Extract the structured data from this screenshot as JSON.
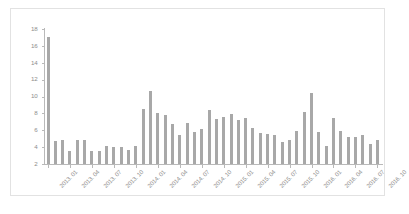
{
  "chart_data": {
    "type": "bar",
    "title": "",
    "subtitle": "",
    "xlabel": "",
    "ylabel": "",
    "ylim": [
      2,
      18
    ],
    "yticks": [
      2,
      4,
      6,
      8,
      10,
      12,
      14,
      16,
      18
    ],
    "grid": false,
    "legend": null,
    "bar_color": "#a8a8a8",
    "axis_color": "#b9b9b9",
    "tick_label_color": "#8d8d8d",
    "categories": [
      "2013. 01",
      "2013. 02",
      "2013. 03",
      "2013. 04",
      "2013. 05",
      "2013. 06",
      "2013. 07",
      "2013. 08",
      "2013. 09",
      "2013. 10",
      "2013. 11",
      "2013. 12",
      "2014. 01",
      "2014. 02",
      "2014. 03",
      "2014. 04",
      "2014. 05",
      "2014. 06",
      "2014. 07",
      "2014. 08",
      "2014. 09",
      "2014. 10",
      "2014. 11",
      "2014. 12",
      "2015. 01",
      "2015. 02",
      "2015. 03",
      "2015. 04",
      "2015. 05",
      "2015. 06",
      "2015. 07",
      "2015. 08",
      "2015. 09",
      "2015. 10",
      "2015. 11",
      "2015. 12",
      "2016. 01",
      "2016. 02",
      "2016. 03",
      "2016. 04",
      "2016. 05",
      "2016. 06",
      "2016. 07",
      "2016. 08",
      "2016. 09",
      "2016. 10"
    ],
    "values": [
      17.0,
      4.7,
      4.8,
      3.5,
      4.9,
      4.8,
      3.6,
      3.6,
      4.1,
      4.0,
      4.0,
      3.7,
      4.1,
      8.5,
      10.6,
      8.1,
      7.8,
      6.8,
      5.4,
      6.9,
      5.8,
      6.1,
      8.4,
      7.3,
      7.6,
      7.9,
      7.2,
      7.4,
      6.3,
      5.7,
      5.5,
      5.4,
      4.6,
      4.8,
      5.9,
      8.2,
      10.4,
      5.8,
      4.1,
      7.5,
      5.9,
      5.2,
      5.2,
      5.4,
      4.4,
      4.8
    ],
    "xtick_labels": [
      "2013. 01",
      "2013. 04",
      "2013. 07",
      "2013. 10",
      "2014. 01",
      "2014. 04",
      "2014. 07",
      "2014. 10",
      "2015. 01",
      "2015. 04",
      "2015. 07",
      "2015. 10",
      "2016. 01",
      "2016. 04",
      "2016. 07",
      "2016. 10"
    ],
    "xtick_indices": [
      0,
      3,
      6,
      9,
      12,
      15,
      18,
      21,
      24,
      27,
      30,
      33,
      36,
      39,
      42,
      45
    ]
  }
}
